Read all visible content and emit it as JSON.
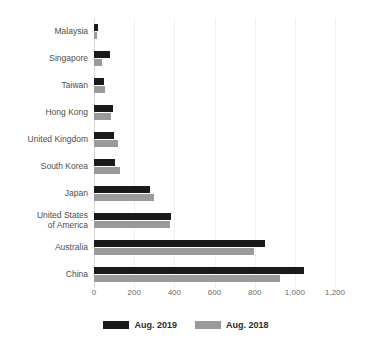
{
  "chart_data": {
    "type": "bar",
    "orientation": "horizontal",
    "title": "",
    "subtitle": "",
    "xlabel": "",
    "ylabel": "",
    "xlim": [
      0,
      1200
    ],
    "xticks": [
      0,
      200,
      400,
      600,
      800,
      1000,
      1200
    ],
    "xtick_labels": [
      "0",
      "200",
      "400",
      "600",
      "800",
      "1,000",
      "1,200"
    ],
    "grid": true,
    "grid_axis": "x",
    "legend_position": "bottom",
    "categories": [
      "Malaysia",
      "Singapore",
      "Taiwan",
      "Hong Kong",
      "United Kingdom",
      "South Korea",
      "Japan",
      "United States\nof America",
      "Australia",
      "China"
    ],
    "series": [
      {
        "name": "Aug. 2019",
        "color": "#1a1a1a",
        "values": [
          20,
          80,
          50,
          95,
          100,
          105,
          280,
          385,
          850,
          1045
        ]
      },
      {
        "name": "Aug. 2018",
        "color": "#9a9a9a",
        "values": [
          15,
          40,
          55,
          85,
          120,
          130,
          300,
          378,
          795,
          925
        ]
      }
    ]
  },
  "legend": {
    "items": [
      {
        "label": "Aug. 2019",
        "color": "#1a1a1a"
      },
      {
        "label": "Aug. 2018",
        "color": "#9a9a9a"
      }
    ]
  },
  "colors": {
    "series_2019": "#1a1a1a",
    "series_2018": "#9a9a9a",
    "gridline": "#f0f0f0",
    "axis": "#d8d8d8",
    "text": "#4d4d4d",
    "background": "#ffffff"
  }
}
